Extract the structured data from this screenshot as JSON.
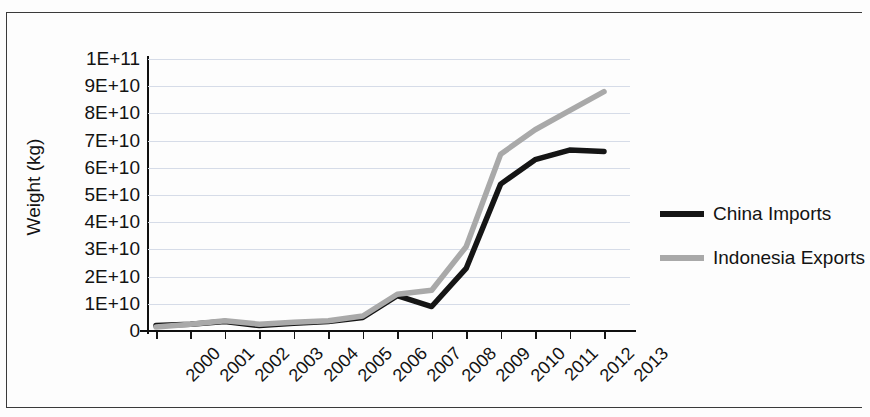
{
  "chart_data": {
    "type": "line",
    "title": "",
    "xlabel": "",
    "ylabel": "Weight (kg)",
    "grid": true,
    "legend_position": "right",
    "ylim": [
      0,
      100000000000
    ],
    "ytick_labels": [
      "1E+11",
      "9E+10",
      "8E+10",
      "7E+10",
      "6E+10",
      "5E+10",
      "4E+10",
      "3E+10",
      "2E+10",
      "1E+10",
      "0"
    ],
    "ytick_values": [
      100000000000,
      90000000000,
      80000000000,
      70000000000,
      60000000000,
      50000000000,
      40000000000,
      30000000000,
      20000000000,
      10000000000,
      0
    ],
    "categories": [
      "2000",
      "2001",
      "2002",
      "2003",
      "2004",
      "2005",
      "2006",
      "2007",
      "2008",
      "2009",
      "2010",
      "2011",
      "2012",
      "2013"
    ],
    "series": [
      {
        "name": "China Imports",
        "color": "#151515",
        "values": [
          2000000000,
          2500000000,
          3500000000,
          2000000000,
          2800000000,
          3500000000,
          5000000000,
          13000000000,
          9000000000,
          23000000000,
          54000000000,
          63000000000,
          66500000000,
          66000000000
        ]
      },
      {
        "name": "Indonesia Exports",
        "color": "#a9a9a9",
        "values": [
          1500000000,
          2500000000,
          3800000000,
          2500000000,
          3200000000,
          3800000000,
          5500000000,
          13500000000,
          15000000000,
          31000000000,
          65000000000,
          74000000000,
          81000000000,
          88000000000
        ]
      }
    ]
  },
  "legend": {
    "items": [
      {
        "label": "China Imports",
        "color": "#151515"
      },
      {
        "label": "Indonesia Exports",
        "color": "#a9a9a9"
      }
    ]
  }
}
